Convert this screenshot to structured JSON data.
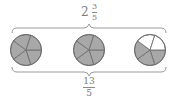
{
  "top_label": {
    "whole": "2",
    "numerator": "3",
    "denominator": "5"
  },
  "bottom_label": {
    "numerator": "13",
    "denominator": "5"
  },
  "circles": [
    {
      "parts": 5,
      "shaded": 5
    },
    {
      "parts": 5,
      "shaded": 5
    },
    {
      "parts": 5,
      "shaded": 3
    }
  ],
  "colors": {
    "shaded": "#a8a8a8",
    "unshaded": "#ffffff",
    "stroke": "#6f6f6f",
    "brace": "#9a9a9a",
    "text": "#7a7a7a"
  }
}
